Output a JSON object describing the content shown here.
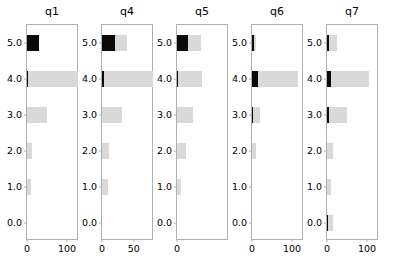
{
  "figure": {
    "background": "#ffffff",
    "bar_color": "#d9d9d9",
    "overlay_color": "#0a0a0a",
    "axis_color": "#b0b0b0"
  },
  "chart_data": {
    "type": "bar",
    "orientation": "horizontal",
    "title": "",
    "xlabel": "",
    "ylabel": "",
    "grid": false,
    "legend": "none",
    "categories": [
      "5.0",
      "4.0",
      "3.0",
      "2.0",
      "1.0",
      "0.0"
    ],
    "panels": [
      {
        "title": "q1",
        "xlim": [
          0,
          130
        ],
        "xticks": [
          0,
          100
        ],
        "xticklabels": [
          "0",
          "100"
        ],
        "series": [
          {
            "name": "total",
            "color": "#d9d9d9",
            "values": [
              30,
              128,
              50,
              13,
              9,
              0
            ]
          },
          {
            "name": "highlight",
            "color": "#0a0a0a",
            "values": [
              30,
              2,
              0,
              0,
              0,
              0
            ]
          }
        ]
      },
      {
        "title": "q4",
        "xlim": [
          0,
          82
        ],
        "xticks": [
          0,
          50
        ],
        "xticklabels": [
          "0",
          "50"
        ],
        "series": [
          {
            "name": "total",
            "color": "#d9d9d9",
            "values": [
              40,
              80,
              32,
              11,
              9,
              0
            ]
          },
          {
            "name": "highlight",
            "color": "#0a0a0a",
            "values": [
              20,
              3,
              0,
              0,
              0,
              0
            ]
          }
        ]
      },
      {
        "title": "q5",
        "xlim": [
          0,
          128
        ],
        "xticks": [
          0
        ],
        "xticklabels": [
          "0"
        ],
        "series": [
          {
            "name": "total",
            "color": "#d9d9d9",
            "values": [
              60,
              62,
              40,
              21,
              9,
              0
            ]
          },
          {
            "name": "highlight",
            "color": "#0a0a0a",
            "values": [
              28,
              3,
              0,
              0,
              0,
              0
            ]
          }
        ]
      },
      {
        "title": "q6",
        "xlim": [
          0,
          130
        ],
        "xticks": [
          0,
          100
        ],
        "xticklabels": [
          "0",
          "100"
        ],
        "series": [
          {
            "name": "total",
            "color": "#d9d9d9",
            "values": [
              11,
              115,
              21,
              11,
              0,
              0
            ]
          },
          {
            "name": "highlight",
            "color": "#0a0a0a",
            "values": [
              6,
              14,
              1,
              0,
              0,
              0
            ]
          }
        ]
      },
      {
        "title": "q7",
        "xlim": [
          0,
          130
        ],
        "xticks": [
          0,
          100
        ],
        "xticklabels": [
          "0",
          "100"
        ],
        "series": [
          {
            "name": "total",
            "color": "#d9d9d9",
            "values": [
              25,
              105,
              50,
              16,
              9,
              14
            ]
          },
          {
            "name": "highlight",
            "color": "#0a0a0a",
            "values": [
              5,
              9,
              4,
              0,
              0,
              3
            ]
          }
        ]
      }
    ]
  }
}
